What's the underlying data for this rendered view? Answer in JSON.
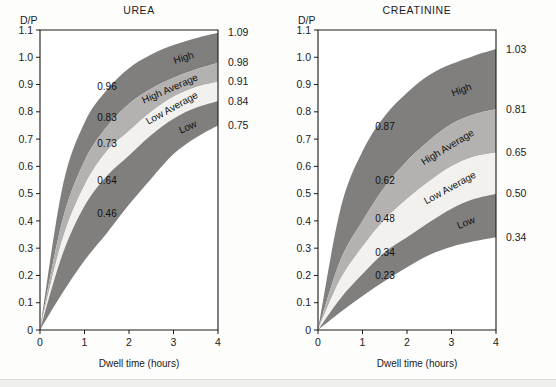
{
  "figure": {
    "background_color": "#fdfdfb",
    "axis_color": "#1b1b1b"
  },
  "colors": {
    "high_band": "#807f7d",
    "high_average_band": "#b3b2b0",
    "low_average_band": "#f2f1ee",
    "low_band": "#807f7d",
    "text": "#1b1b1b"
  },
  "panels": [
    {
      "key": "urea",
      "title": "UREA",
      "ylabel": "D/P",
      "xlabel": "Dwell time (hours)",
      "yticks": [
        "1.1",
        "1.0",
        "0.9",
        "0.8",
        "0.7",
        "0.6",
        "0.5",
        "0.4",
        "0.3",
        "0.2",
        "0.1",
        "0"
      ],
      "xticks": [
        "0",
        "1",
        "2",
        "3",
        "4"
      ],
      "right_labels": [
        "1.09",
        "0.98",
        "0.91",
        "0.84",
        "0.75"
      ],
      "band_labels": [
        "High",
        "High Average",
        "Low Average",
        "Low"
      ],
      "inline_labels": [
        "0.96",
        "0.83",
        "0.73",
        "0.64",
        "0.46"
      ]
    },
    {
      "key": "creatinine",
      "title": "CREATININE",
      "ylabel": "D/P",
      "xlabel": "Dwell time (hours)",
      "yticks": [
        "1.1",
        "1.0",
        "0.9",
        "0.8",
        "0.7",
        "0.6",
        "0.5",
        "0.4",
        "0.3",
        "0.2",
        "0.1",
        "0"
      ],
      "xticks": [
        "0",
        "1",
        "2",
        "3",
        "4"
      ],
      "right_labels": [
        "1.03",
        "0.81",
        "0.65",
        "0.50",
        "0.34"
      ],
      "band_labels": [
        "High",
        "High Average",
        "Low Average",
        "Low"
      ],
      "inline_labels": [
        "0.87",
        "0.62",
        "0.48",
        "0.34",
        "0.23"
      ]
    }
  ],
  "chart_data": [
    {
      "type": "area",
      "title": "UREA",
      "xlabel": "Dwell time (hours)",
      "ylabel": "D/P",
      "xlim": [
        0,
        4
      ],
      "ylim": [
        0,
        1.1
      ],
      "grid": false,
      "x": [
        0,
        0.5,
        1,
        1.5,
        2,
        2.5,
        3,
        3.5,
        4
      ],
      "boundaries": [
        {
          "name": "High max",
          "values": [
            0.0,
            0.52,
            0.76,
            0.88,
            0.96,
            1.01,
            1.045,
            1.07,
            1.09
          ]
        },
        {
          "name": "High / High Average",
          "values": [
            0.0,
            0.4,
            0.62,
            0.745,
            0.83,
            0.885,
            0.925,
            0.955,
            0.98
          ]
        },
        {
          "name": "High Average / Low Average",
          "values": [
            0.0,
            0.33,
            0.53,
            0.655,
            0.73,
            0.8,
            0.855,
            0.89,
            0.91
          ]
        },
        {
          "name": "Low Average / Low",
          "values": [
            0.0,
            0.275,
            0.455,
            0.565,
            0.64,
            0.715,
            0.775,
            0.815,
            0.84
          ]
        },
        {
          "name": "Low min",
          "values": [
            0.0,
            0.135,
            0.255,
            0.355,
            0.46,
            0.555,
            0.645,
            0.705,
            0.75
          ]
        }
      ],
      "bands": [
        {
          "name": "High",
          "end_value": 1.09,
          "annotation": "0.96",
          "annotation_x": 2
        },
        {
          "name": "High Average",
          "end_value": 0.98,
          "annotation": "0.83",
          "annotation_x": 2
        },
        {
          "name": "Low Average",
          "end_value": 0.91,
          "annotation": "0.73",
          "annotation_x": 2
        },
        {
          "name": "Low",
          "end_value": 0.84,
          "annotation": "0.64",
          "annotation_x": 2
        },
        {
          "name": "Low min",
          "end_value": 0.75,
          "annotation": "0.46",
          "annotation_x": 2
        }
      ],
      "right_axis_values": [
        1.09,
        0.98,
        0.91,
        0.84,
        0.75
      ],
      "inline_values_at_2h": [
        0.96,
        0.83,
        0.73,
        0.64,
        0.46
      ]
    },
    {
      "type": "area",
      "title": "CREATININE",
      "xlabel": "Dwell time (hours)",
      "ylabel": "D/P",
      "xlim": [
        0,
        4
      ],
      "ylim": [
        0,
        1.1
      ],
      "grid": false,
      "x": [
        0,
        0.5,
        1,
        1.5,
        2,
        2.5,
        3,
        3.5,
        4
      ],
      "boundaries": [
        {
          "name": "High max",
          "values": [
            0.0,
            0.44,
            0.655,
            0.785,
            0.87,
            0.935,
            0.975,
            1.005,
            1.03
          ]
        },
        {
          "name": "High / High Average",
          "values": [
            0.0,
            0.255,
            0.4,
            0.525,
            0.62,
            0.695,
            0.755,
            0.79,
            0.81
          ]
        },
        {
          "name": "High Average / Low Average",
          "values": [
            0.0,
            0.185,
            0.305,
            0.405,
            0.48,
            0.545,
            0.6,
            0.635,
            0.65
          ]
        },
        {
          "name": "Low Average / Low",
          "values": [
            0.0,
            0.115,
            0.205,
            0.285,
            0.34,
            0.395,
            0.445,
            0.48,
            0.5
          ]
        },
        {
          "name": "Low min",
          "values": [
            0.0,
            0.065,
            0.125,
            0.18,
            0.23,
            0.275,
            0.305,
            0.325,
            0.34
          ]
        }
      ],
      "bands": [
        {
          "name": "High",
          "end_value": 1.03,
          "annotation": "0.87",
          "annotation_x": 2
        },
        {
          "name": "High Average",
          "end_value": 0.81,
          "annotation": "0.62",
          "annotation_x": 2
        },
        {
          "name": "Low Average",
          "end_value": 0.65,
          "annotation": "0.48",
          "annotation_x": 2
        },
        {
          "name": "Low",
          "end_value": 0.5,
          "annotation": "0.34",
          "annotation_x": 2
        },
        {
          "name": "Low min",
          "end_value": 0.34,
          "annotation": "0.23",
          "annotation_x": 2
        }
      ],
      "right_axis_values": [
        1.03,
        0.81,
        0.65,
        0.5,
        0.34
      ],
      "inline_values_at_2h": [
        0.87,
        0.62,
        0.48,
        0.34,
        0.23
      ]
    }
  ]
}
